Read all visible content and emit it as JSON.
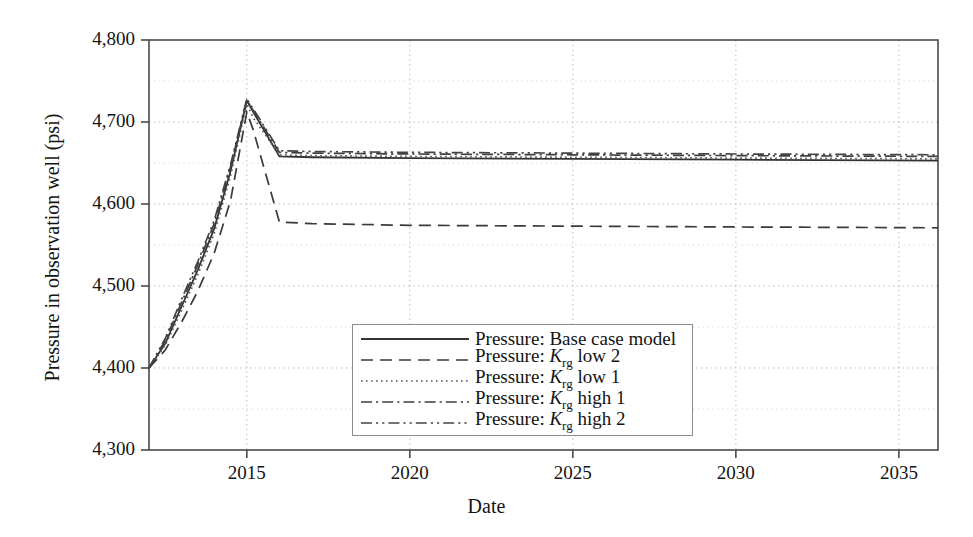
{
  "chart_data": {
    "type": "line",
    "title": "",
    "xlabel": "Date",
    "ylabel": "Pressure in observation well (psi)",
    "xlim": [
      2012,
      2036.2
    ],
    "ylim": [
      4300,
      4800
    ],
    "xticks": [
      "2015",
      "2020",
      "2025",
      "2030",
      "2035"
    ],
    "xtick_values": [
      2015,
      2020,
      2025,
      2030,
      2035
    ],
    "yticks": [
      "4,300",
      "4,400",
      "4,500",
      "4,600",
      "4,700",
      "4,800"
    ],
    "ytick_values": [
      4300,
      4400,
      4500,
      4600,
      4700,
      4800
    ],
    "grid": "dotted-minor-and-major",
    "legend_position": "lower-center",
    "series": [
      {
        "name": "Pressure: Base case model",
        "label_prefix": "Pressure: ",
        "label_var": "",
        "label_sub": "",
        "label_suffix": "Base case model",
        "style": "solid",
        "dash": "none",
        "color": "#333333",
        "x": [
          2012.0,
          2012.5,
          2013.0,
          2013.5,
          2014.0,
          2014.5,
          2015.0,
          2015.2,
          2016.0,
          2017.0,
          2020.0,
          2025.0,
          2030.0,
          2036.2
        ],
        "y": [
          4400,
          4430,
          4475,
          4520,
          4570,
          4640,
          4726,
          4712,
          4658,
          4657,
          4656,
          4655,
          4654,
          4653
        ]
      },
      {
        "name": "Pressure: Krg low 2",
        "label_prefix": "Pressure: ",
        "label_var": "K",
        "label_sub": "rg",
        "label_suffix": " low 2",
        "style": "dashed",
        "dash": "12,7",
        "color": "#3a3a3a",
        "x": [
          2012.0,
          2012.5,
          2013.0,
          2013.5,
          2014.0,
          2014.5,
          2015.0,
          2015.2,
          2016.0,
          2017.0,
          2020.0,
          2025.0,
          2030.0,
          2036.2
        ],
        "y": [
          4400,
          4422,
          4456,
          4494,
          4540,
          4604,
          4712,
          4690,
          4578,
          4576,
          4574,
          4573,
          4572,
          4571
        ]
      },
      {
        "name": "Pressure: Krg low 1",
        "label_prefix": "Pressure: ",
        "label_var": "K",
        "label_sub": "rg",
        "label_suffix": " low 1",
        "style": "dotted",
        "dash": "1.6,3.4",
        "color": "#555555",
        "x": [
          2012.0,
          2012.5,
          2013.0,
          2013.5,
          2014.0,
          2014.5,
          2015.0,
          2015.2,
          2016.0,
          2017.0,
          2020.0,
          2025.0,
          2030.0,
          2036.2
        ],
        "y": [
          4400,
          4428,
          4470,
          4514,
          4564,
          4634,
          4722,
          4705,
          4660,
          4659,
          4658,
          4657,
          4656,
          4655
        ]
      },
      {
        "name": "Pressure: Krg high 1",
        "label_prefix": "Pressure: ",
        "label_var": "K",
        "label_sub": "rg",
        "label_suffix": " high 1",
        "style": "dash-dot",
        "dash": "11,4,2.2,4",
        "color": "#3f3f3f",
        "x": [
          2012.0,
          2012.5,
          2013.0,
          2013.5,
          2014.0,
          2014.5,
          2015.0,
          2015.2,
          2016.0,
          2017.0,
          2020.0,
          2025.0,
          2030.0,
          2036.2
        ],
        "y": [
          4400,
          4434,
          4480,
          4526,
          4576,
          4645,
          4727,
          4714,
          4663,
          4662,
          4661,
          4660,
          4659,
          4658
        ]
      },
      {
        "name": "Pressure: Krg high 2",
        "label_prefix": "Pressure: ",
        "label_var": "K",
        "label_sub": "rg",
        "label_suffix": " high 2",
        "style": "dash-dot-dot",
        "dash": "11,4,2.2,4,2.2,4",
        "color": "#444444",
        "x": [
          2012.0,
          2012.5,
          2013.0,
          2013.5,
          2014.0,
          2014.5,
          2015.0,
          2015.2,
          2016.0,
          2017.0,
          2020.0,
          2025.0,
          2030.0,
          2036.2
        ],
        "y": [
          4400,
          4436,
          4484,
          4530,
          4580,
          4648,
          4728,
          4716,
          4665,
          4664,
          4663,
          4662,
          4661,
          4660
        ]
      }
    ]
  },
  "axes": {
    "x_title": "Date",
    "y_title": "Pressure in observation well (psi)"
  },
  "colors": {
    "axis": "#4a4a4a",
    "grid": "#bdbdbd",
    "text": "#141414",
    "background": "#ffffff",
    "legend_border": "#8c8c8c"
  }
}
